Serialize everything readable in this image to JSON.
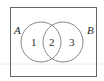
{
  "diagram": {
    "type": "venn",
    "universe": {
      "x": 10,
      "y": 7,
      "width": 87,
      "height": 70,
      "stroke": "#555555"
    },
    "faint_line": {
      "y": 64,
      "color": "#e6e6e6"
    },
    "sets": [
      {
        "label": "A",
        "cx": 41,
        "cy": 42,
        "r": 20,
        "label_x": 14,
        "label_y": 34
      },
      {
        "label": "B",
        "cx": 63,
        "cy": 42,
        "r": 20,
        "label_x": 87,
        "label_y": 34
      }
    ],
    "regions": [
      {
        "label": "1",
        "x": 34,
        "y": 46
      },
      {
        "label": "2",
        "x": 52,
        "y": 46
      },
      {
        "label": "3",
        "x": 71,
        "y": 46
      }
    ],
    "circle_stroke": "#777777"
  }
}
